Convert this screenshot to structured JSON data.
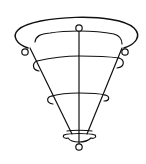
{
  "figure": {
    "subject": "inverted cone wire frame",
    "line_color": "#111111",
    "background": "#ffffff",
    "parts": [
      "outer-rim-arc",
      "inner-rim-arc",
      "top-knob",
      "left-rim-knob",
      "right-rim-knob",
      "left-side-strut",
      "right-side-strut",
      "center-axis",
      "upper-ring",
      "middle-ring",
      "bottom-ring",
      "bottom-knob"
    ]
  }
}
